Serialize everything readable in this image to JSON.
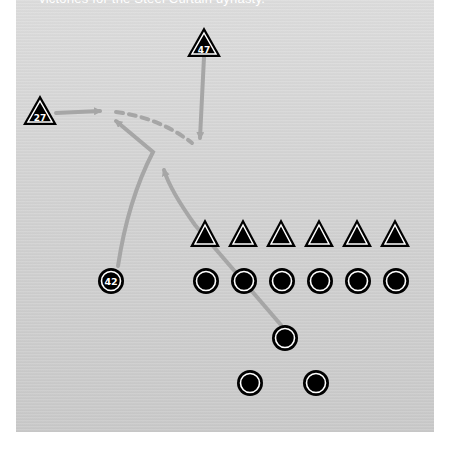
{
  "caption": "victories for the Steel Curtain dynasty.",
  "diagram": {
    "type": "football play diagram",
    "colors": {
      "background": "#d2d2d2",
      "player_fill": "#000000",
      "player_ring": "#ffffff",
      "route": "#a6a6a6"
    },
    "defense_labeled": [
      {
        "number": "27",
        "shape": "triangle",
        "x": 40,
        "y": 112
      },
      {
        "number": "47",
        "shape": "triangle",
        "x": 204,
        "y": 44
      }
    ],
    "offense_labeled": [
      {
        "number": "42",
        "shape": "circle",
        "x": 111,
        "y": 281
      }
    ],
    "defensive_line": [
      "triangle",
      "triangle",
      "triangle",
      "triangle",
      "triangle",
      "triangle"
    ],
    "offensive_line": [
      "circle",
      "circle",
      "circle",
      "circle",
      "circle",
      "circle"
    ],
    "backfield": [
      "circle",
      "circle",
      "circle"
    ],
    "routes": [
      {
        "from": "27",
        "style": "solid",
        "arrow": true
      },
      {
        "from": "47",
        "style": "solid",
        "arrow": true
      },
      {
        "from": "pass",
        "style": "dashed",
        "arrow": false
      },
      {
        "from": "42",
        "style": "solid",
        "arrow": true
      },
      {
        "from": "quarterback",
        "style": "solid",
        "arrow": true
      }
    ]
  }
}
